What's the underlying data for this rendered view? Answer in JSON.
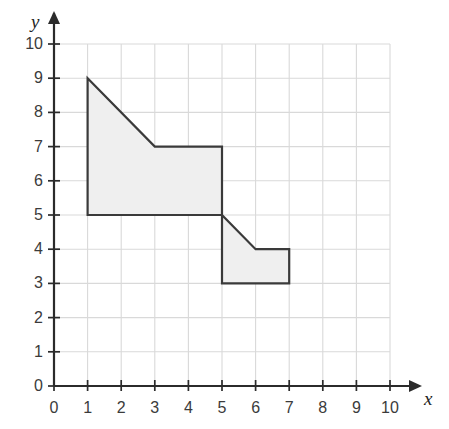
{
  "chart_data": {
    "type": "scatter",
    "title": "",
    "xlabel": "x",
    "ylabel": "y",
    "xlim": [
      0,
      10
    ],
    "ylim": [
      0,
      10
    ],
    "grid": true,
    "legend": null,
    "x_ticks": [
      "0",
      "1",
      "2",
      "3",
      "4",
      "5",
      "6",
      "7",
      "8",
      "9",
      "10"
    ],
    "y_ticks": [
      "0",
      "1",
      "2",
      "3",
      "4",
      "5",
      "6",
      "7",
      "8",
      "9",
      "10"
    ],
    "x_tick_values": [
      0,
      1,
      2,
      3,
      4,
      5,
      6,
      7,
      8,
      9,
      10
    ],
    "y_tick_values": [
      0,
      1,
      2,
      3,
      4,
      5,
      6,
      7,
      8,
      9,
      10
    ],
    "shapes": [
      {
        "name": "shaded-polygon",
        "kind": "polygon",
        "closed": true,
        "fill": "#efefef",
        "stroke": "#3a3a3a",
        "stroke_width": 2.2,
        "vertices": [
          [
            1,
            9
          ],
          [
            3,
            7
          ],
          [
            5,
            7
          ],
          [
            5,
            5
          ],
          [
            6,
            4
          ],
          [
            7,
            4
          ],
          [
            7,
            3
          ],
          [
            5,
            3
          ],
          [
            5,
            5
          ],
          [
            1,
            5
          ]
        ],
        "vertices_simple": [
          [
            1,
            9
          ],
          [
            3,
            7
          ],
          [
            5,
            7
          ],
          [
            5,
            5
          ],
          [
            6,
            4
          ],
          [
            7,
            4
          ],
          [
            7,
            3
          ],
          [
            5,
            3
          ],
          [
            5,
            5
          ],
          [
            1,
            5
          ],
          [
            1,
            9
          ]
        ]
      }
    ],
    "annotations": []
  },
  "axes": {
    "x_axis_label": "x",
    "y_axis_label": "y",
    "origin_label": "0"
  },
  "colors": {
    "background": "#ffffff",
    "grid": "#d9d9d9",
    "axis": "#2b2b2b",
    "shape_fill": "#efefef",
    "shape_stroke": "#3a3a3a",
    "tick_text": "#3b3b3b"
  }
}
